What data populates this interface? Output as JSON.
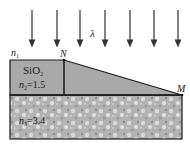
{
  "diagram": {
    "incident_light_label": "λ",
    "medium_label": "n",
    "medium_sub": "1",
    "film_material": "SiO",
    "film_material_sub": "2",
    "film_index_label": "n",
    "film_index_sub": "2",
    "film_index_value": "=1.5",
    "substrate_index_label": "n",
    "substrate_index_sub": "3",
    "substrate_index_value": "=3.4",
    "point_N": "N",
    "point_M": "M",
    "arrow_count": 7,
    "colors": {
      "film_fill": "#a9a9a9",
      "substrate_fill": "#b5b5b5",
      "outline": "#1a1a1a",
      "arrow": "#333333"
    }
  }
}
